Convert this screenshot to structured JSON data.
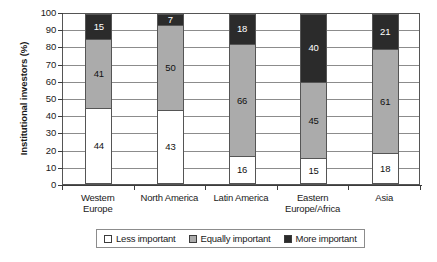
{
  "chart_data": {
    "type": "bar",
    "subtype": "stacked-100-percent",
    "title": "",
    "xlabel": "",
    "ylabel": "Institutional investors (%)",
    "ylim": [
      0,
      100
    ],
    "ytick_step": 10,
    "yticks": [
      100,
      90,
      80,
      70,
      60,
      50,
      40,
      30,
      20,
      10,
      0
    ],
    "grid": true,
    "grid_axis": "y",
    "legend_position": "bottom",
    "categories": [
      "Western Europe",
      "North America",
      "Latin America",
      "Eastern Europe/Africa",
      "Asia"
    ],
    "category_lines": [
      [
        "Western",
        "Europe"
      ],
      [
        "North America"
      ],
      [
        "Latin America"
      ],
      [
        "Eastern",
        "Europe/Africa"
      ],
      [
        "Asia"
      ]
    ],
    "series": [
      {
        "name": "Less important",
        "color": "#ffffff",
        "values": [
          44,
          43,
          16,
          15,
          18
        ]
      },
      {
        "name": "Equally important",
        "color": "#ababab",
        "values": [
          41,
          50,
          66,
          45,
          61
        ]
      },
      {
        "name": "More important",
        "color": "#2b2b2b",
        "values": [
          15,
          7,
          18,
          40,
          21
        ]
      }
    ]
  },
  "legend": {
    "items": [
      {
        "label": "Less important",
        "swatch": "#ffffff"
      },
      {
        "label": "Equally important",
        "swatch": "#ababab"
      },
      {
        "label": "More important",
        "swatch": "#2b2b2b"
      }
    ]
  },
  "axes": {
    "y_title": "Institutional investors (%)"
  }
}
